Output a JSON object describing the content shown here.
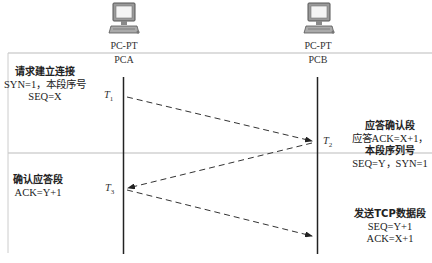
{
  "nodes": [
    {
      "id": "pca",
      "type": "PC-PT",
      "name": "PCA",
      "icon": "desktop-computer-icon"
    },
    {
      "id": "pcb",
      "type": "PC-PT",
      "name": "PCB",
      "icon": "desktop-computer-icon"
    }
  ],
  "time_markers": [
    {
      "label": "T",
      "sub": "1"
    },
    {
      "label": "T",
      "sub": "2"
    },
    {
      "label": "T",
      "sub": "3"
    }
  ],
  "notes": {
    "syn": {
      "title": "请求建立连接",
      "line2": "SYN=1，本段序号",
      "line3": "SEQ=X"
    },
    "synack": {
      "title": "应答确认段",
      "line2": "应答ACK=X+1，",
      "line3": "本段序列号",
      "line4": "SEQ=Y，SYN=1"
    },
    "ack": {
      "title": "确认应答段",
      "line2": "ACK=Y+1"
    },
    "data": {
      "title": "发送TCP数据段",
      "line2": "SEQ=Y+1",
      "line3": "ACK=X+1"
    }
  },
  "colors": {
    "lifeline": "#222222",
    "arrow": "#333333",
    "divider": "#bbbbbb"
  }
}
